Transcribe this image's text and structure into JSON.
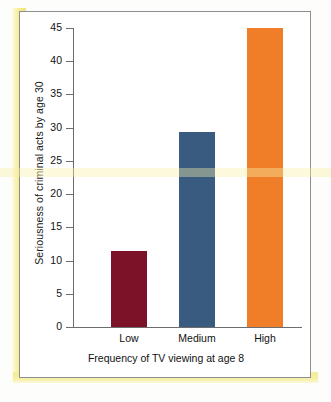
{
  "chart_data": {
    "type": "bar",
    "title": "",
    "categories": [
      "Low",
      "Medium",
      "High"
    ],
    "values": [
      11.5,
      29.3,
      45
    ],
    "series": [
      {
        "name": "Seriousness of criminal acts by age 30",
        "values": [
          11.5,
          29.3,
          45
        ]
      }
    ],
    "xlabel": "Frequency of TV viewing at age 8",
    "ylabel": "Seriousness of criminal acts by age 30",
    "ylim": [
      0,
      45
    ],
    "yticks": [
      0,
      5,
      10,
      15,
      20,
      25,
      30,
      35,
      40,
      45
    ],
    "ytick_labels": [
      "0",
      "5",
      "10",
      "15",
      "20",
      "25",
      "30",
      "35",
      "40",
      "45"
    ],
    "grid": false,
    "legend": "none",
    "bar_colors": [
      "#7B1228",
      "#3A5B80",
      "#F07D28"
    ]
  },
  "axes": {
    "y_title": "Seriousness of criminal acts by age 30",
    "x_title": "Frequency of TV viewing at age 8"
  },
  "colors": {
    "bar_low": "#7B1228",
    "bar_medium": "#3A5B80",
    "bar_high": "#F07D28",
    "frame_border": "#8e8e90",
    "axis_line": "#6d6d6f",
    "highlight_band": "#f4e77e",
    "page_background": "#fdfdfb"
  }
}
